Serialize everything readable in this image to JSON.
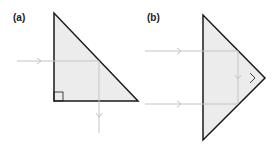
{
  "panels": [
    {
      "label": "(a)",
      "description": "Right-angle prism, single ray reflected downward"
    },
    {
      "label": "(b)",
      "description": "Right-angle prism, two rays reflected back (retroreflection)"
    }
  ],
  "colors": {
    "prism_fill": "#ececec",
    "prism_stroke": "#1a1a1a",
    "ray": "#c8c8c8"
  }
}
